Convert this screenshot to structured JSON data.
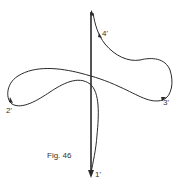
{
  "figure": {
    "caption": "Fig. 46",
    "labels": {
      "p1": "1'",
      "p2": "2'",
      "p3": "3'",
      "p4": "4'"
    },
    "stroke_color": "#2a2a2a",
    "background": "#ffffff"
  }
}
